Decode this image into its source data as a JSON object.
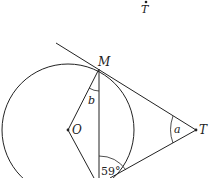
{
  "diagram": {
    "type": "circle-tangent-geometry",
    "stray_label": {
      "text": "T"
    },
    "points": {
      "M": {
        "label": "M"
      },
      "O": {
        "label": "O"
      },
      "T": {
        "label": "T"
      }
    },
    "angles": {
      "a": {
        "label": "a"
      },
      "b": {
        "label": "b"
      },
      "given": {
        "label": "59°"
      }
    },
    "colors": {
      "stroke": "#222222",
      "background": "#ffffff"
    }
  }
}
